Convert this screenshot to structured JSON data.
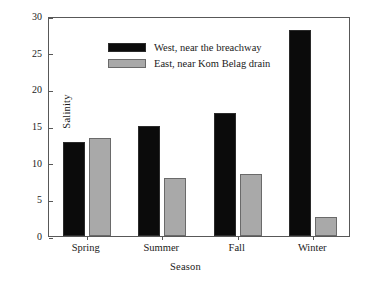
{
  "chart_data": {
    "type": "bar",
    "title": "",
    "xlabel": "Season",
    "ylabel": "Salinity",
    "categories": [
      "Spring",
      "Summer",
      "Fall",
      "Winter"
    ],
    "series": [
      {
        "name": "West, near the breachway",
        "color": "#0b0b0b",
        "values": [
          12.8,
          15.0,
          16.8,
          28.1
        ]
      },
      {
        "name": "East, near Kom Belag drain",
        "color": "#a9a9a9",
        "values": [
          13.3,
          7.9,
          8.4,
          2.6
        ]
      }
    ],
    "ylim": [
      0,
      30
    ],
    "yticks": [
      0,
      5,
      10,
      15,
      20,
      25,
      30
    ],
    "ytick_labels": [
      "0",
      "5",
      "10",
      "15",
      "20",
      "25",
      "30"
    ],
    "grid": false,
    "legend_position": "top-left",
    "frame": true
  }
}
